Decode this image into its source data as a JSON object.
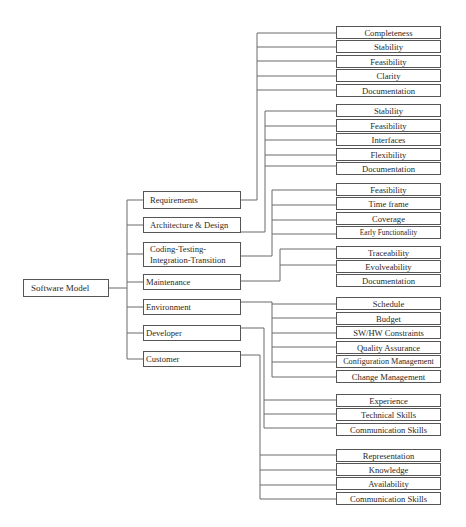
{
  "diagram": {
    "root": {
      "label": "Software Model"
    },
    "categories": [
      {
        "label": "Requirements"
      },
      {
        "label": "Architecture & Design"
      },
      {
        "label": "Coding-Testing-Integration-Transition"
      },
      {
        "label": "Maintenance"
      },
      {
        "label": "Environment"
      },
      {
        "label": "Developer"
      },
      {
        "label": "Customer"
      }
    ],
    "groups": {
      "requirements": [
        "Completeness",
        "Stability",
        "Feasibility",
        "Clarity",
        "Documentation"
      ],
      "architecture": [
        "Stability",
        "Feasibility",
        "Interfaces",
        "Flexibility",
        "Documentation"
      ],
      "coding": [
        "Feasibility",
        "Time frame",
        "Coverage",
        "Early Functionality"
      ],
      "maintenance": [
        "Traceability",
        "Evolveability",
        "Documentation"
      ],
      "environment": [
        "Schedule",
        "Budget",
        "SW/HW Constraints",
        "Quality Assurance",
        "Configuration Management",
        "Change Management"
      ],
      "developer": [
        "Experience",
        "Technical Skills",
        "Communication Skills"
      ],
      "customer": [
        "Representation",
        "Knowledge",
        "Availability",
        "Communication Skills"
      ]
    },
    "colors": {
      "line": "#555555",
      "box_border": "#555555",
      "text": "#2a2a2a",
      "background": "#ffffff"
    }
  }
}
